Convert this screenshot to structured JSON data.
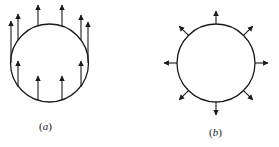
{
  "figure": {
    "panels": [
      {
        "id": "a",
        "label": "(a)",
        "description": "Circle with uniform parallel vertical arrows (uniform field)",
        "circle": {
          "cx": 49.5,
          "cy": 63,
          "r": 39
        },
        "arrows": [
          {
            "x": 11,
            "y1": 63,
            "y2": 21
          },
          {
            "x": 18,
            "y1": 40,
            "y2": 14
          },
          {
            "x": 38,
            "y1": 26,
            "y2": 5
          },
          {
            "x": 62,
            "y1": 26,
            "y2": 5
          },
          {
            "x": 81,
            "y1": 40,
            "y2": 15
          },
          {
            "x": 88,
            "y1": 63,
            "y2": 22
          },
          {
            "x": 18,
            "y1": 87,
            "y2": 61
          },
          {
            "x": 38,
            "y1": 100,
            "y2": 76
          },
          {
            "x": 62,
            "y1": 100,
            "y2": 76
          },
          {
            "x": 81,
            "y1": 87,
            "y2": 61
          }
        ],
        "label_pos": {
          "x": 39,
          "y": 120
        }
      },
      {
        "id": "b",
        "label": "(b)",
        "description": "Circle with 8 radially outward arrows (radial field)",
        "circle": {
          "cx": 216,
          "cy": 63,
          "r": 39
        },
        "arrow_length": 13,
        "arrow_angles_deg": [
          0,
          45,
          90,
          135,
          180,
          225,
          270,
          315
        ],
        "label_pos": {
          "x": 209,
          "y": 126
        }
      }
    ],
    "colors": {
      "stroke": "#1a1a1a",
      "background": "#ffffff"
    }
  }
}
